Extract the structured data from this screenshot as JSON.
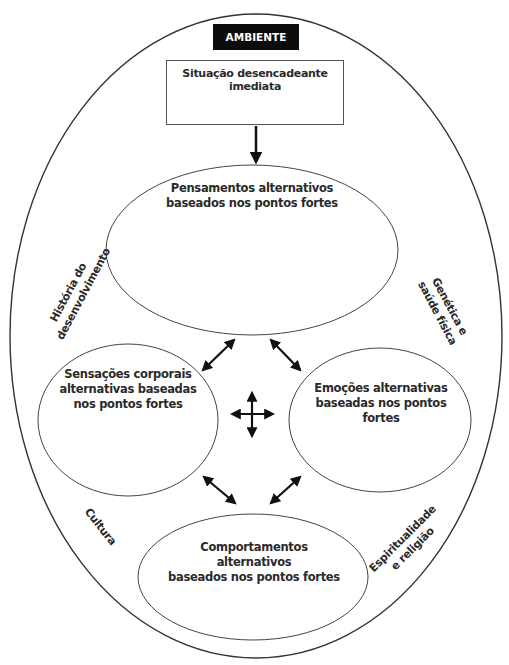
{
  "diagram": {
    "environment_label": "AMBIENTE",
    "trigger_box": "Situação desencadeante imediata",
    "nodes": {
      "thoughts": "Pensamentos alternativos baseados nos pontos fortes",
      "thoughts_line1": "Pensamentos alternativos",
      "thoughts_line2": "baseados nos pontos fortes",
      "body_sensations_line1": "Sensações corporais",
      "body_sensations_line2": "alternativas baseadas",
      "body_sensations_line3": "nos pontos fortes",
      "emotions_line1": "Emoções alternativas",
      "emotions_line2": "baseadas nos pontos fortes",
      "behaviors_line1": "Comportamentos alternativos",
      "behaviors_line2": "baseados nos pontos fortes"
    },
    "outer_factors": {
      "development_history_line1": "História do",
      "development_history_line2": "desenvolvimento",
      "genetics_line1": "Genética e",
      "genetics_line2": "saúde física",
      "culture": "Cultura",
      "spirituality_line1": "Espiritualidade",
      "spirituality_line2": "e religião"
    },
    "colors": {
      "line": "#3a3a3a",
      "label_bg": "#0c0c0c",
      "label_text": "#ffffff",
      "text": "#2a2a2a"
    }
  }
}
